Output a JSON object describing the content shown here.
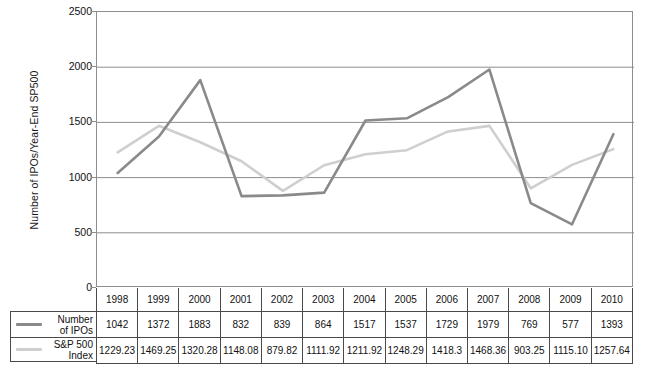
{
  "chart_data": {
    "type": "line",
    "title": "",
    "xlabel": "",
    "ylabel": "Number of IPOs/Year-End SP500",
    "ylim": [
      0,
      2500
    ],
    "ytick_step": 500,
    "yticks": [
      0,
      500,
      1000,
      1500,
      2000,
      2500
    ],
    "grid": true,
    "legend_position": "table-left",
    "categories": [
      "1998",
      "1999",
      "2000",
      "2001",
      "2002",
      "2003",
      "2004",
      "2005",
      "2006",
      "2007",
      "2008",
      "2009",
      "2010"
    ],
    "series": [
      {
        "name": "Number of IPOs",
        "color": "#8a8a8a",
        "values": [
          1042,
          1372,
          1883,
          832,
          839,
          864,
          1517,
          1537,
          1729,
          1979,
          769,
          577,
          1393
        ],
        "labels": [
          "1042",
          "1372",
          "1883",
          "832",
          "839",
          "864",
          "1517",
          "1537",
          "1729",
          "1979",
          "769",
          "577",
          "1393"
        ]
      },
      {
        "name": "S&P 500 Index",
        "color": "#cfcfcf",
        "values": [
          1229.23,
          1469.25,
          1320.28,
          1148.08,
          879.82,
          1111.92,
          1211.92,
          1248.29,
          1418.3,
          1468.36,
          903.25,
          1115.1,
          1257.64
        ],
        "labels": [
          "1229.23",
          "1469.25",
          "1320.28",
          "1148.08",
          "879.82",
          "1111.92",
          "1211.92",
          "1248.29",
          "1418.3",
          "1468.36",
          "903.25",
          "1115.10",
          "1257.64"
        ]
      }
    ]
  },
  "axis": {
    "y_title": "Number of IPOs/Year-End SP500",
    "y_tick_labels": [
      "2500",
      "2000",
      "1500",
      "1000",
      "500",
      "0"
    ]
  },
  "legend": {
    "items": [
      {
        "label_line1": "Number",
        "label_line2": "of IPOs",
        "color": "#8a8a8a"
      },
      {
        "label_line1": "S&P 500",
        "label_line2": "Index",
        "color": "#cfcfcf"
      }
    ]
  },
  "table": {
    "years": [
      "1998",
      "1999",
      "2000",
      "2001",
      "2002",
      "2003",
      "2004",
      "2005",
      "2006",
      "2007",
      "2008",
      "2009",
      "2010"
    ],
    "rows": [
      {
        "label_line1": "Number",
        "label_line2": "of IPOs",
        "values": [
          "1042",
          "1372",
          "1883",
          "832",
          "839",
          "864",
          "1517",
          "1537",
          "1729",
          "1979",
          "769",
          "577",
          "1393"
        ]
      },
      {
        "label_line1": "S&P 500",
        "label_line2": "Index",
        "values": [
          "1229.23",
          "1469.25",
          "1320.28",
          "1148.08",
          "879.82",
          "1111.92",
          "1211.92",
          "1248.29",
          "1418.3",
          "1468.36",
          "903.25",
          "1115.10",
          "1257.64"
        ]
      }
    ]
  },
  "footer": {
    "faint_text": ""
  }
}
